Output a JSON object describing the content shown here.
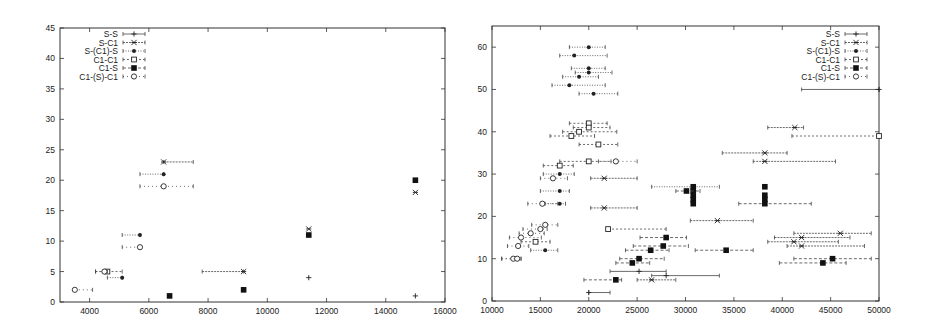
{
  "chart_data": [
    {
      "type": "scatter",
      "title": "",
      "xlabel": "",
      "ylabel": "",
      "xlim": [
        3000,
        16000
      ],
      "ylim": [
        0,
        45
      ],
      "xticks": [
        4000,
        6000,
        8000,
        10000,
        12000,
        14000,
        16000
      ],
      "yticks": [
        0,
        5,
        10,
        15,
        20,
        25,
        30,
        35,
        40,
        45
      ],
      "grid": false,
      "legend_position": "top-left",
      "plot_box": {
        "x0": 60,
        "x1": 445,
        "y0": 302,
        "y1": 28
      },
      "legend": {
        "x": 118,
        "y": 34
      },
      "series": [
        {
          "name": "S-S",
          "marker": "plus",
          "points": [
            {
              "x": 15000,
              "y": 1,
              "xmin": 15000,
              "xmax": 15000
            },
            {
              "x": 11400,
              "y": 4,
              "xmin": 11400,
              "xmax": 11400
            }
          ]
        },
        {
          "name": "S-C1",
          "marker": "star",
          "points": [
            {
              "x": 6500,
              "y": 23,
              "xmin": 6500,
              "xmax": 7500
            },
            {
              "x": 9200,
              "y": 5,
              "xmin": 7800,
              "xmax": 9200
            },
            {
              "x": 11400,
              "y": 12,
              "xmin": 11400,
              "xmax": 11400
            },
            {
              "x": 15000,
              "y": 18,
              "xmin": 15000,
              "xmax": 15000
            }
          ]
        },
        {
          "name": "S-(C1)-S",
          "marker": "filled-circle-small",
          "points": [
            {
              "x": 6500,
              "y": 21,
              "xmin": 5700,
              "xmax": 6500
            },
            {
              "x": 5700,
              "y": 11,
              "xmin": 5100,
              "xmax": 5700
            },
            {
              "x": 5100,
              "y": 4,
              "xmin": 4600,
              "xmax": 5100
            }
          ]
        },
        {
          "name": "C1-C1",
          "marker": "open-square",
          "points": [
            {
              "x": 4600,
              "y": 5,
              "xmin": 4200,
              "xmax": 5100
            }
          ]
        },
        {
          "name": "C1-S",
          "marker": "filled-square",
          "points": [
            {
              "x": 6700,
              "y": 1,
              "xmin": 6700,
              "xmax": 6700
            },
            {
              "x": 9200,
              "y": 2,
              "xmin": 9200,
              "xmax": 9200
            },
            {
              "x": 11400,
              "y": 11,
              "xmin": 11400,
              "xmax": 11400
            },
            {
              "x": 15000,
              "y": 20,
              "xmin": 15000,
              "xmax": 15000
            }
          ]
        },
        {
          "name": "C1-(S)-C1",
          "marker": "open-circle",
          "points": [
            {
              "x": 6500,
              "y": 19,
              "xmin": 5700,
              "xmax": 7500
            },
            {
              "x": 5700,
              "y": 9,
              "xmin": 5100,
              "xmax": 5700
            },
            {
              "x": 4500,
              "y": 5,
              "xmin": 4200,
              "xmax": 4600
            },
            {
              "x": 3500,
              "y": 2,
              "xmin": 3500,
              "xmax": 4100
            }
          ]
        }
      ]
    },
    {
      "type": "scatter",
      "title": "",
      "xlabel": "",
      "ylabel": "",
      "xlim": [
        10000,
        50000
      ],
      "ylim": [
        0,
        65
      ],
      "xticks": [
        10000,
        15000,
        20000,
        25000,
        30000,
        35000,
        40000,
        45000,
        50000
      ],
      "yticks": [
        0,
        10,
        20,
        30,
        40,
        50,
        60
      ],
      "grid": false,
      "legend_position": "top-right",
      "plot_box": {
        "x0": 492,
        "x1": 879,
        "y0": 301,
        "y1": 26
      },
      "legend": {
        "x": 840,
        "y": 34
      },
      "series": [
        {
          "name": "S-S",
          "marker": "plus",
          "points": [
            {
              "x": 50000,
              "y": 50,
              "xmin": 42000,
              "xmax": 50000
            },
            {
              "x": 25200,
              "y": 7,
              "xmin": 22200,
              "xmax": 28000
            },
            {
              "x": 28000,
              "y": 6,
              "xmin": 26500,
              "xmax": 33500
            },
            {
              "x": 20000,
              "y": 2,
              "xmin": 20000,
              "xmax": 22200
            }
          ]
        },
        {
          "name": "S-C1",
          "marker": "star",
          "points": [
            {
              "x": 21600,
              "y": 29,
              "xmin": 20200,
              "xmax": 25000
            },
            {
              "x": 21600,
              "y": 22,
              "xmin": 20200,
              "xmax": 25000
            },
            {
              "x": 41300,
              "y": 41,
              "xmin": 38500,
              "xmax": 42200
            },
            {
              "x": 38200,
              "y": 35,
              "xmin": 33800,
              "xmax": 40500
            },
            {
              "x": 38200,
              "y": 33,
              "xmin": 37000,
              "xmax": 45500
            },
            {
              "x": 33300,
              "y": 19,
              "xmin": 30500,
              "xmax": 37000
            },
            {
              "x": 46000,
              "y": 16,
              "xmin": 41200,
              "xmax": 49200
            },
            {
              "x": 42000,
              "y": 15,
              "xmin": 39200,
              "xmax": 47000
            },
            {
              "x": 41200,
              "y": 14,
              "xmin": 38500,
              "xmax": 45800
            },
            {
              "x": 42000,
              "y": 13,
              "xmin": 40500,
              "xmax": 48500
            },
            {
              "x": 26500,
              "y": 5,
              "xmin": 25000,
              "xmax": 29000
            }
          ]
        },
        {
          "name": "S-(C1)-S",
          "marker": "filled-circle-small",
          "points": [
            {
              "x": 20000,
              "y": 60,
              "xmin": 18000,
              "xmax": 21700
            },
            {
              "x": 18500,
              "y": 58,
              "xmin": 17000,
              "xmax": 21900
            },
            {
              "x": 20000,
              "y": 55,
              "xmin": 18200,
              "xmax": 21700
            },
            {
              "x": 20000,
              "y": 54,
              "xmin": 18600,
              "xmax": 22400
            },
            {
              "x": 19000,
              "y": 53,
              "xmin": 17300,
              "xmax": 21000
            },
            {
              "x": 18000,
              "y": 51,
              "xmin": 16200,
              "xmax": 21700
            },
            {
              "x": 20500,
              "y": 49,
              "xmin": 19000,
              "xmax": 23000
            },
            {
              "x": 17000,
              "y": 30,
              "xmin": 15300,
              "xmax": 18500
            },
            {
              "x": 17000,
              "y": 26,
              "xmin": 15000,
              "xmax": 18000
            },
            {
              "x": 17000,
              "y": 23,
              "xmin": 15500,
              "xmax": 17600
            },
            {
              "x": 15500,
              "y": 12,
              "xmin": 14000,
              "xmax": 16800
            },
            {
              "x": 30800,
              "y": 27,
              "xmin": 26500,
              "xmax": 33500
            }
          ]
        },
        {
          "name": "C1-C1",
          "marker": "open-square",
          "points": [
            {
              "x": 20000,
              "y": 42,
              "xmin": 18000,
              "xmax": 21900
            },
            {
              "x": 20000,
              "y": 41,
              "xmin": 18400,
              "xmax": 22200
            },
            {
              "x": 19000,
              "y": 40,
              "xmin": 17300,
              "xmax": 22900
            },
            {
              "x": 18200,
              "y": 39,
              "xmin": 16000,
              "xmax": 20600
            },
            {
              "x": 21000,
              "y": 37,
              "xmin": 19000,
              "xmax": 23000
            },
            {
              "x": 20000,
              "y": 33,
              "xmin": 17000,
              "xmax": 22300
            },
            {
              "x": 50000,
              "y": 39,
              "xmin": 41000,
              "xmax": 50000
            },
            {
              "x": 17000,
              "y": 32,
              "xmin": 15300,
              "xmax": 18400
            },
            {
              "x": 14500,
              "y": 14,
              "xmin": 13000,
              "xmax": 16000
            },
            {
              "x": 22000,
              "y": 17,
              "xmin": 22000,
              "xmax": 28000
            }
          ]
        },
        {
          "name": "C1-S",
          "marker": "filled-square",
          "points": [
            {
              "x": 30800,
              "y": 27,
              "xmin": 30800,
              "xmax": 30800
            },
            {
              "x": 30800,
              "y": 26,
              "xmin": 30000,
              "xmax": 30800
            },
            {
              "x": 30800,
              "y": 25,
              "xmin": 30800,
              "xmax": 30800
            },
            {
              "x": 30800,
              "y": 24,
              "xmin": 30800,
              "xmax": 30800
            },
            {
              "x": 30800,
              "y": 23,
              "xmin": 30800,
              "xmax": 30800
            },
            {
              "x": 30100,
              "y": 26,
              "xmin": 29000,
              "xmax": 31500
            },
            {
              "x": 38200,
              "y": 27,
              "xmin": 38200,
              "xmax": 38200
            },
            {
              "x": 38200,
              "y": 25,
              "xmin": 38200,
              "xmax": 38200
            },
            {
              "x": 38200,
              "y": 24,
              "xmin": 38200,
              "xmax": 38200
            },
            {
              "x": 38200,
              "y": 23,
              "xmin": 35500,
              "xmax": 43000
            },
            {
              "x": 28000,
              "y": 15,
              "xmin": 25300,
              "xmax": 30100
            },
            {
              "x": 27700,
              "y": 13,
              "xmin": 24600,
              "xmax": 30300
            },
            {
              "x": 26400,
              "y": 12,
              "xmin": 23800,
              "xmax": 28300
            },
            {
              "x": 25200,
              "y": 10,
              "xmin": 23200,
              "xmax": 27800
            },
            {
              "x": 24500,
              "y": 9,
              "xmin": 22800,
              "xmax": 26300
            },
            {
              "x": 22800,
              "y": 5,
              "xmin": 19500,
              "xmax": 23400
            },
            {
              "x": 34200,
              "y": 12,
              "xmin": 31000,
              "xmax": 37000
            },
            {
              "x": 45200,
              "y": 10,
              "xmin": 41200,
              "xmax": 49200
            },
            {
              "x": 44200,
              "y": 9,
              "xmin": 39700,
              "xmax": 46600
            }
          ]
        },
        {
          "name": "C1-(S)-C1",
          "marker": "open-circle",
          "points": [
            {
              "x": 16300,
              "y": 29,
              "xmin": 15000,
              "xmax": 17800
            },
            {
              "x": 15200,
              "y": 23,
              "xmin": 13700,
              "xmax": 16800
            },
            {
              "x": 15500,
              "y": 18,
              "xmin": 14100,
              "xmax": 16800
            },
            {
              "x": 15000,
              "y": 17,
              "xmin": 13200,
              "xmax": 15700
            },
            {
              "x": 14000,
              "y": 16,
              "xmin": 12800,
              "xmax": 15400
            },
            {
              "x": 13000,
              "y": 15,
              "xmin": 11800,
              "xmax": 15100
            },
            {
              "x": 12700,
              "y": 13,
              "xmin": 11600,
              "xmax": 13800
            },
            {
              "x": 12200,
              "y": 10,
              "xmin": 11000,
              "xmax": 13000
            },
            {
              "x": 12600,
              "y": 10,
              "xmin": 11000,
              "xmax": 13000
            },
            {
              "x": 22800,
              "y": 33,
              "xmin": 21000,
              "xmax": 25000
            }
          ]
        }
      ]
    }
  ]
}
